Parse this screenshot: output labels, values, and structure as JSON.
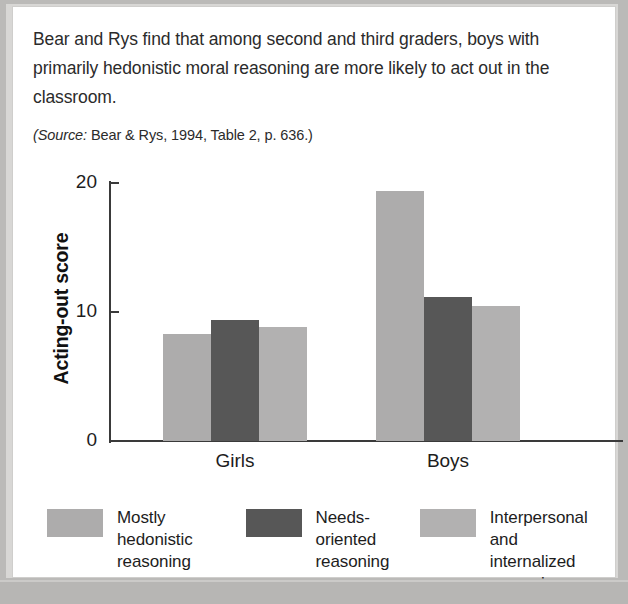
{
  "caption": {
    "body": "Bear and Rys find that among second and third graders, boys with primarily hedonistic moral reasoning are more likely to act out in the classroom.",
    "source_word": "(Source:",
    "source_rest": " Bear & Rys, 1994, Table 2, p. 636.)"
  },
  "colors": {
    "bar_light": "#adacac",
    "bar_dark": "#575757",
    "bar_light_alt": "#b2b1b1",
    "axis": "#3a3a3a",
    "text": "#1d1d1d",
    "page_background": "#b9b8b6",
    "card_background": "#ffffff"
  },
  "chart_data": {
    "type": "bar",
    "title": "",
    "xlabel": "",
    "ylabel": "Acting-out score",
    "categories": [
      "Girls",
      "Boys"
    ],
    "ylim": [
      0,
      20
    ],
    "yticks": [
      0,
      10,
      20
    ],
    "ytick_labels": [
      "0",
      "10",
      "20"
    ],
    "grid": false,
    "legend_position": "bottom",
    "series": [
      {
        "name": "Mostly hedonistic reasoning",
        "legend_label": "Mostly\nhedonistic\nreasoning",
        "color": "#adacac",
        "values": [
          8.3,
          19.4
        ]
      },
      {
        "name": "Needs-oriented reasoning",
        "legend_label": "Needs-\noriented\nreasoning",
        "color": "#575757",
        "values": [
          9.4,
          11.2
        ]
      },
      {
        "name": "Interpersonal and internalized reasoning",
        "legend_label": "Interpersonal\nand internalized\nreasoning",
        "color": "#b2b1b1",
        "values": [
          8.8,
          10.5
        ]
      }
    ]
  }
}
